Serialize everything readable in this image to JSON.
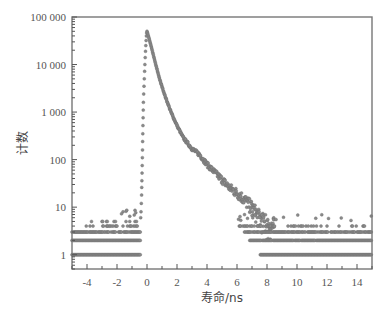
{
  "chart_data": {
    "type": "scatter",
    "title": "",
    "xlabel": "寿命/ns",
    "ylabel": "计数",
    "xlim": [
      -5,
      15
    ],
    "ylim": [
      0.5,
      100000
    ],
    "yscale": "log",
    "grid": false,
    "legend": null,
    "x_ticks": [
      -4,
      -2,
      0,
      2,
      4,
      6,
      8,
      10,
      12,
      14
    ],
    "x_tick_labels": [
      "-4",
      "-2",
      "0",
      "2",
      "4",
      "6",
      "8",
      "10",
      "12",
      "14"
    ],
    "y_ticks": [
      1,
      10,
      100,
      1000,
      10000,
      100000
    ],
    "y_tick_labels": [
      "1",
      "10",
      "100",
      "1 000",
      "10 000",
      "100 000"
    ],
    "series": [
      {
        "name": "decay",
        "description": "Fluorescence lifetime decay: background ~1-5 counts before -0.4 ns, sharp rise to peak ~50000 at ~0 ns, multi-exponential decay to background by ~8 ns, quantized background counts 1-5 thereafter",
        "peak": {
          "x": 0.0,
          "y": 50000
        },
        "x": [
          -0.4,
          -0.3,
          -0.2,
          -0.1,
          0.0,
          0.2,
          0.4,
          0.6,
          0.87,
          1.2,
          1.6,
          2.0,
          2.4,
          3.0,
          3.5,
          4.0,
          4.5,
          5.0,
          5.5,
          6.2,
          7.0,
          7.5,
          8.0
        ],
        "y": [
          5,
          60,
          1500,
          20000,
          50000,
          30000,
          17000,
          9500,
          4600,
          2200,
          1000,
          520,
          295,
          170,
          128,
          80,
          55,
          38,
          26,
          18,
          10,
          6,
          4
        ]
      }
    ],
    "background_levels": [
      1,
      2,
      3,
      4,
      5
    ]
  }
}
